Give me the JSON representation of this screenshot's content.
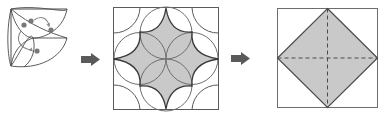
{
  "diagram": {
    "background_color": "#ffffff",
    "stroke_color": "#3a3a3a",
    "light_stroke_color": "#6e6e6e",
    "fill_color": "#c9c9c9",
    "arrow_color": "#5a5a5a",
    "dot_color": "#707070",
    "steps": [
      {
        "index": 1,
        "name": "trefoil-quadrant",
        "label": "",
        "description": "Quarter square containing three overlapping petal arcs meeting at the corner vertex, with four marker dots and two curved rotation arrows",
        "box": {
          "x": 10,
          "y": 8,
          "width": 58,
          "height": 60
        },
        "dots": [
          {
            "cx": 24,
            "cy": 25,
            "r": 2.6
          },
          {
            "cx": 31,
            "cy": 21,
            "r": 2.6
          },
          {
            "cx": 51,
            "cy": 30,
            "r": 2.6
          },
          {
            "cx": 37,
            "cy": 51,
            "r": 2.6
          }
        ],
        "curved_arrows": [
          {
            "name": "rotation-arrow-top",
            "from": [
              33,
              21
            ],
            "to": [
              47,
              27
            ]
          },
          {
            "name": "rotation-arrow-left",
            "from": [
              22,
              29
            ],
            "to": [
              33,
              49
            ]
          }
        ]
      },
      {
        "index": 2,
        "name": "eight-point-star-square",
        "label": "",
        "description": "Square with four corner quarter circles and four edge-midpoint circles forming a shaded concave eight-pointed star",
        "box": {
          "x": 113,
          "y": 7,
          "width": 106,
          "height": 103
        }
      },
      {
        "index": 3,
        "name": "inscribed-diamond-square",
        "label": "",
        "description": "Square with a shaded inscribed diamond and dashed diagonal fold lines",
        "box": {
          "x": 277,
          "y": 8,
          "width": 101,
          "height": 100
        }
      }
    ],
    "arrows": [
      {
        "index": 1,
        "name": "transition-arrow-1",
        "label": "",
        "x": 81,
        "y": 53,
        "width": 19,
        "height": 13
      },
      {
        "index": 2,
        "name": "transition-arrow-2",
        "label": "",
        "x": 231,
        "y": 52,
        "width": 19,
        "height": 13
      }
    ]
  }
}
